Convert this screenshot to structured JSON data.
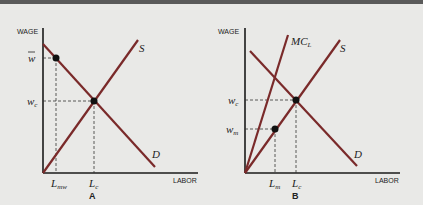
{
  "panels": [
    {
      "id": "A",
      "caption": "A",
      "y_axis_label": "WAGE",
      "x_axis_label": "LABOR",
      "curves": {
        "supply": "S",
        "demand": "D"
      },
      "y_ticks": {
        "min_wage": "w̄",
        "competitive_wage": "wc"
      },
      "x_ticks": {
        "min_wage_labor": "Lmw",
        "competitive_labor": "Lc"
      }
    },
    {
      "id": "B",
      "caption": "B",
      "y_axis_label": "WAGE",
      "x_axis_label": "LABOR",
      "curves": {
        "marginal_cost": "MCL",
        "supply": "S",
        "demand": "D"
      },
      "y_ticks": {
        "competitive_wage": "wc",
        "monopsony_wage": "wm"
      },
      "x_ticks": {
        "monopsony_labor": "Lm",
        "competitive_labor": "Lc"
      }
    }
  ],
  "colors": {
    "curve": "#7a2a2a",
    "axis": "#1a1a1a",
    "background": "#e9e9e7"
  }
}
